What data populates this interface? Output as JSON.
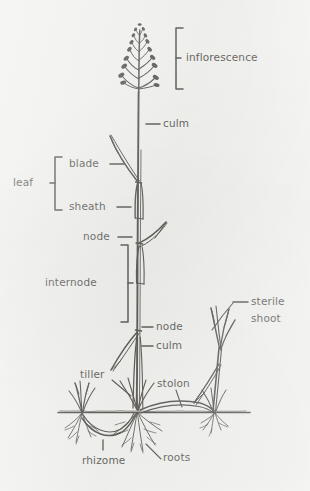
{
  "figure": {
    "background_color": "#f7f7f5",
    "ink_color": "#15130f",
    "soil_line": {
      "y": 412,
      "x_start": 58,
      "x_end": 250
    }
  },
  "labels": {
    "inflorescence": "inflorescence",
    "culm_upper": "culm",
    "blade": "blade",
    "leaf": "leaf",
    "sheath": "sheath",
    "node_upper": "node",
    "internode": "internode",
    "node_lower": "node",
    "culm_lower": "culm",
    "sterile_shoot_line1": "sterile",
    "sterile_shoot_line2": "shoot",
    "tiller": "tiller",
    "stolon": "stolon",
    "rhizome": "rhizome",
    "roots": "roots"
  },
  "parts": [
    {
      "name": "inflorescence",
      "label": "inflorescence",
      "marker": "bracket",
      "description": "open branching panicle of spikelets at top of culm"
    },
    {
      "name": "culm-upper",
      "label": "culm",
      "marker": "leader-dash",
      "description": "flowering stem above the leaves"
    },
    {
      "name": "blade",
      "label": "blade",
      "marker": "leader-dash",
      "description": "flat expanded part of the leaf"
    },
    {
      "name": "leaf",
      "label": "leaf",
      "marker": "bracket",
      "description": "grouping bracket spanning blade and sheath"
    },
    {
      "name": "sheath",
      "label": "sheath",
      "marker": "leader-dash",
      "description": "lower leaf part wrapping the culm"
    },
    {
      "name": "node-upper",
      "label": "node",
      "marker": "leader-dash",
      "description": "joint of the culm where leaf attaches"
    },
    {
      "name": "internode",
      "label": "internode",
      "marker": "bracket",
      "description": "culm segment between two nodes"
    },
    {
      "name": "node-lower",
      "label": "node",
      "marker": "leader-dash",
      "description": "lower joint of the culm"
    },
    {
      "name": "culm-lower",
      "label": "culm",
      "marker": "leader-dash",
      "description": "lower stem section"
    },
    {
      "name": "sterile-shoot",
      "label": "sterile shoot",
      "marker": "leader-dash",
      "description": "non-flowering leafy shoot at right"
    },
    {
      "name": "tiller",
      "label": "tiller",
      "marker": "leader-line",
      "description": "secondary shoot arising at plant base"
    },
    {
      "name": "stolon",
      "label": "stolon",
      "marker": "leader-line",
      "description": "horizontal above-ground runner"
    },
    {
      "name": "rhizome",
      "label": "rhizome",
      "marker": "leader-tick",
      "description": "horizontal below-ground stem"
    },
    {
      "name": "roots",
      "label": "roots",
      "marker": "leader-line",
      "description": "fibrous root system below soil line"
    }
  ]
}
